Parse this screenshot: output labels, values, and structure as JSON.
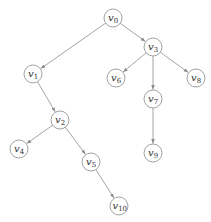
{
  "diagram": {
    "type": "tree",
    "directed": true,
    "node_radius": 9,
    "colors": {
      "node_stroke": "#8a8a8a",
      "edge": "#9a9a9a",
      "text": "#333333",
      "background": "#ffffff"
    },
    "nodes": [
      {
        "id": "v0",
        "base": "v",
        "sub": "0",
        "x": 113,
        "y": 18
      },
      {
        "id": "v1",
        "base": "v",
        "sub": "1",
        "x": 33,
        "y": 74
      },
      {
        "id": "v2",
        "base": "v",
        "sub": "2",
        "x": 60,
        "y": 120
      },
      {
        "id": "v3",
        "base": "v",
        "sub": "3",
        "x": 153,
        "y": 47
      },
      {
        "id": "v4",
        "base": "v",
        "sub": "4",
        "x": 19,
        "y": 149
      },
      {
        "id": "v5",
        "base": "v",
        "sub": "5",
        "x": 91,
        "y": 162
      },
      {
        "id": "v6",
        "base": "v",
        "sub": "6",
        "x": 116,
        "y": 78
      },
      {
        "id": "v7",
        "base": "v",
        "sub": "7",
        "x": 153,
        "y": 99
      },
      {
        "id": "v8",
        "base": "v",
        "sub": "8",
        "x": 196,
        "y": 78
      },
      {
        "id": "v9",
        "base": "v",
        "sub": "9",
        "x": 153,
        "y": 153
      },
      {
        "id": "v10",
        "base": "v",
        "sub": "10",
        "x": 119,
        "y": 206
      }
    ],
    "edges": [
      {
        "from": "v0",
        "to": "v1"
      },
      {
        "from": "v0",
        "to": "v3"
      },
      {
        "from": "v1",
        "to": "v2"
      },
      {
        "from": "v2",
        "to": "v4"
      },
      {
        "from": "v2",
        "to": "v5"
      },
      {
        "from": "v5",
        "to": "v10"
      },
      {
        "from": "v3",
        "to": "v6"
      },
      {
        "from": "v3",
        "to": "v7"
      },
      {
        "from": "v3",
        "to": "v8"
      },
      {
        "from": "v7",
        "to": "v9"
      }
    ]
  }
}
